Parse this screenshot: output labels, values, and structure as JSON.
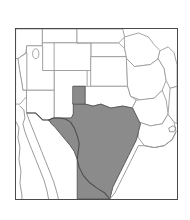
{
  "figure": {
    "type": "thematic-map",
    "title": "",
    "region": "Southwestern and South Central United States",
    "frame": {
      "x": 15,
      "y": 28,
      "width": 163,
      "height": 172,
      "border_color": "#4a4a4a",
      "background_color": "#ffffff"
    },
    "canvas": {
      "width": 190,
      "height": 220,
      "background_color": "#ffffff"
    }
  },
  "legend": {
    "visible": false,
    "entries": [
      {
        "label": "Highlighted state",
        "color": "#8b8b8b"
      },
      {
        "label": "Other states",
        "color": "#ffffff"
      }
    ]
  },
  "style": {
    "highlight_fill": "#8b8b8b",
    "highlight_stroke": "#5a5a5a",
    "state_fill": "#ffffff",
    "state_stroke": "#9a9a9a",
    "national_border_stroke": "#4f4f4f",
    "coast_stroke": "#8f8f8f"
  },
  "map_features": {
    "highlighted_states": [
      {
        "name": "Texas",
        "abbr": "TX",
        "shaded": true,
        "fill": "#8b8b8b"
      }
    ],
    "plain_states": [
      {
        "name": "California",
        "abbr": "CA",
        "shaded": false
      },
      {
        "name": "Nevada",
        "abbr": "NV",
        "shaded": false
      },
      {
        "name": "Utah",
        "abbr": "UT",
        "shaded": false
      },
      {
        "name": "Arizona",
        "abbr": "AZ",
        "shaded": false
      },
      {
        "name": "Idaho",
        "abbr": "ID",
        "shaded": false
      },
      {
        "name": "Wyoming",
        "abbr": "WY",
        "shaded": false
      },
      {
        "name": "Colorado",
        "abbr": "CO",
        "shaded": false
      },
      {
        "name": "New Mexico",
        "abbr": "NM",
        "shaded": false
      },
      {
        "name": "Nebraska",
        "abbr": "NE",
        "shaded": false
      },
      {
        "name": "Kansas",
        "abbr": "KS",
        "shaded": false
      },
      {
        "name": "Oklahoma",
        "abbr": "OK",
        "shaded": false
      },
      {
        "name": "South Dakota",
        "abbr": "SD",
        "shaded": false
      },
      {
        "name": "Iowa",
        "abbr": "IA",
        "shaded": false
      },
      {
        "name": "Missouri",
        "abbr": "MO",
        "shaded": false
      },
      {
        "name": "Arkansas",
        "abbr": "AR",
        "shaded": false
      },
      {
        "name": "Louisiana",
        "abbr": "LA",
        "shaded": false
      }
    ],
    "water_bodies": [
      {
        "name": "Great Salt Lake",
        "type": "lake"
      },
      {
        "name": "Gulf of California",
        "type": "gulf"
      },
      {
        "name": "Gulf of Mexico",
        "type": "gulf"
      }
    ],
    "other_landforms": [
      {
        "name": "Baja California Peninsula",
        "type": "peninsula",
        "country": "Mexico"
      }
    ],
    "borders": [
      {
        "name": "United States - Mexico border",
        "type": "international"
      },
      {
        "name": "Rio Grande",
        "type": "river-border"
      }
    ]
  }
}
